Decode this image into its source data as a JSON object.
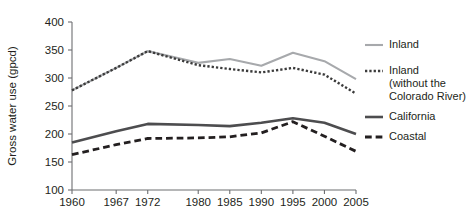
{
  "chart_data": {
    "type": "line",
    "title": "",
    "xlabel": "",
    "ylabel": "Gross water use (gpcd)",
    "x": [
      1960,
      1967,
      1972,
      1980,
      1985,
      1990,
      1995,
      2000,
      2005
    ],
    "xticklabels": [
      "1960",
      "1967",
      "1972",
      "1980",
      "1985",
      "1990",
      "1995",
      "2000",
      "2005"
    ],
    "yticklabels": [
      "100",
      "150",
      "200",
      "250",
      "300",
      "350",
      "400"
    ],
    "yticks": [
      100,
      150,
      200,
      250,
      300,
      350,
      400
    ],
    "ylim": [
      100,
      400
    ],
    "grid": false,
    "legend_position": "right",
    "series": [
      {
        "name": "Inland",
        "style": "solid",
        "color": "#a7a9ac",
        "width": 2.1,
        "values": [
          278,
          318,
          348,
          327,
          334,
          322,
          345,
          330,
          298
        ]
      },
      {
        "name": "Inland (without the Colorado River)",
        "style": "dotted",
        "color": "#3b3b3b",
        "width": 2.4,
        "values": [
          278,
          318,
          348,
          323,
          316,
          310,
          318,
          306,
          272
        ]
      },
      {
        "name": "California",
        "style": "solid",
        "color": "#4d4d4f",
        "width": 2.6,
        "values": [
          185,
          205,
          218,
          216,
          214,
          220,
          228,
          220,
          200
        ]
      },
      {
        "name": "Coastal",
        "style": "dashed",
        "color": "#231f20",
        "width": 2.8,
        "values": [
          163,
          181,
          192,
          193,
          195,
          202,
          222,
          196,
          169
        ]
      }
    ]
  },
  "legend": {
    "entries": [
      {
        "label_lines": [
          "Inland"
        ]
      },
      {
        "label_lines": [
          "Inland",
          "(without the",
          "Colorado River)"
        ]
      },
      {
        "label_lines": [
          "California"
        ]
      },
      {
        "label_lines": [
          "Coastal"
        ]
      }
    ]
  },
  "colors": {
    "inland": "#a7a9ac",
    "inland_no_colorado": "#3b3b3b",
    "california": "#4d4d4f",
    "coastal": "#231f20",
    "axis": "#6d6e71",
    "text": "#231f20",
    "background": "#ffffff"
  }
}
